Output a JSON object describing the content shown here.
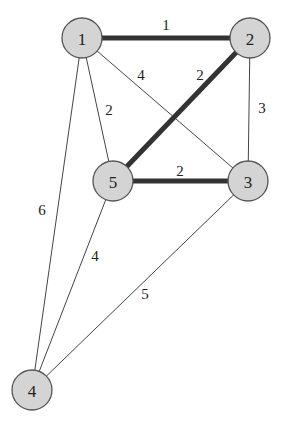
{
  "graph": {
    "nodes": [
      {
        "id": "1",
        "label": "1",
        "x": 82,
        "y": 38
      },
      {
        "id": "2",
        "label": "2",
        "x": 250,
        "y": 38
      },
      {
        "id": "3",
        "label": "3",
        "x": 248,
        "y": 181
      },
      {
        "id": "4",
        "label": "4",
        "x": 32,
        "y": 390
      },
      {
        "id": "5",
        "label": "5",
        "x": 113,
        "y": 181
      }
    ],
    "edges": [
      {
        "from": "1",
        "to": "2",
        "weight": "1",
        "highlighted": true,
        "label_x": 166,
        "label_y": 25
      },
      {
        "from": "1",
        "to": "3",
        "weight": "4",
        "highlighted": false,
        "label_x": 141,
        "label_y": 75
      },
      {
        "from": "2",
        "to": "5",
        "weight": "2",
        "highlighted": true,
        "label_x": 200,
        "label_y": 75
      },
      {
        "from": "1",
        "to": "5",
        "weight": "2",
        "highlighted": false,
        "label_x": 109,
        "label_y": 110
      },
      {
        "from": "2",
        "to": "3",
        "weight": "3",
        "highlighted": false,
        "label_x": 262,
        "label_y": 108
      },
      {
        "from": "5",
        "to": "3",
        "weight": "2",
        "highlighted": true,
        "label_x": 180,
        "label_y": 171
      },
      {
        "from": "1",
        "to": "4",
        "weight": "6",
        "highlighted": false,
        "label_x": 42,
        "label_y": 210
      },
      {
        "from": "5",
        "to": "4",
        "weight": "4",
        "highlighted": false,
        "label_x": 95,
        "label_y": 256
      },
      {
        "from": "3",
        "to": "4",
        "weight": "5",
        "highlighted": false,
        "label_x": 145,
        "label_y": 294
      }
    ],
    "node_radius": 20,
    "colors": {
      "node_fill": "#d4d4d4",
      "node_stroke": "#555555",
      "highlight_edge": "#333333",
      "edge": "#444444"
    }
  }
}
